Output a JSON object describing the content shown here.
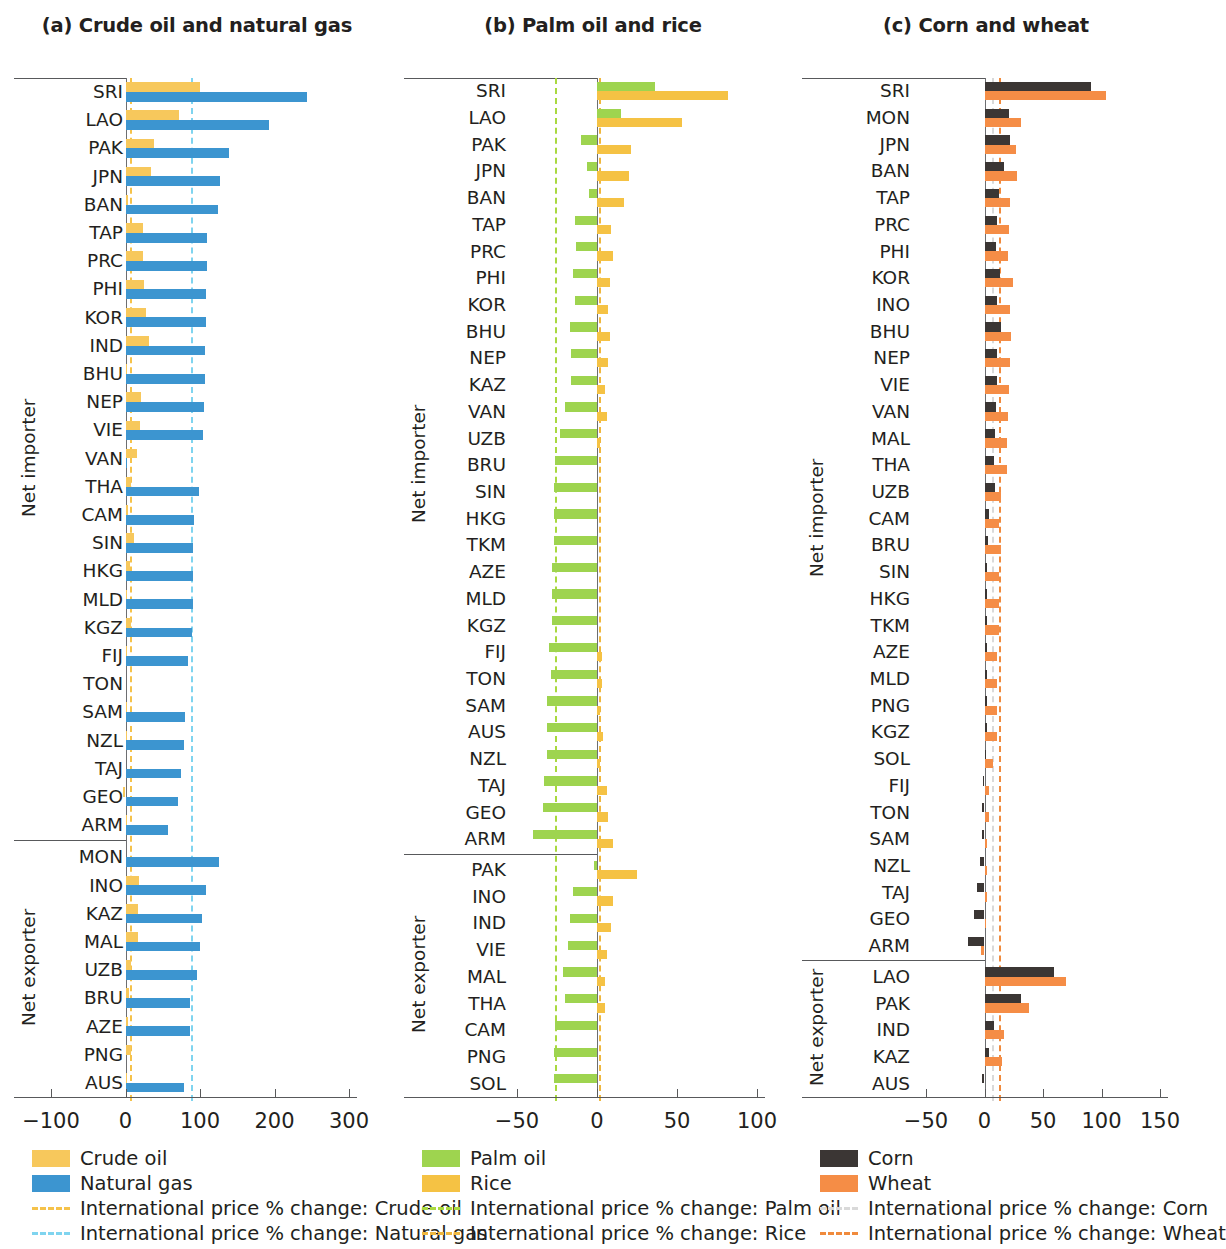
{
  "figure": {
    "type": "grouped-horizontal-bar",
    "panel_count": 3
  },
  "panels": {
    "a": {
      "title": "(a) Crude oil and natural gas",
      "group_labels": {
        "importer": "Net importer",
        "exporter": "Net exporter"
      },
      "axis": {
        "ticks": [
          -100,
          0,
          100,
          200,
          300
        ],
        "tick_labels": [
          "−100",
          "0",
          "100",
          "200",
          "300"
        ],
        "min": -135,
        "max": 335
      },
      "reflines": [
        {
          "label": "International price % change: Crude oil",
          "value": 6,
          "color": "#f5c24a"
        },
        {
          "label": "International price % change: Natural gas",
          "value": 88,
          "color": "#7fd4ef"
        }
      ],
      "series": [
        {
          "name": "Crude oil",
          "color": "#f7c85c"
        },
        {
          "name": "Natural gas",
          "color": "#3c95d0"
        }
      ],
      "legend": [
        {
          "kind": "swatch",
          "label": "Crude oil",
          "color": "#f7c85c"
        },
        {
          "kind": "swatch",
          "label": "Natural gas",
          "color": "#3c95d0"
        },
        {
          "kind": "dash",
          "label": "International price % change: Crude oil",
          "color": "#f5c24a"
        },
        {
          "kind": "dash",
          "label": "International price % change: Natural gas",
          "color": "#7fd4ef"
        }
      ]
    },
    "b": {
      "title": "(b) Palm oil and rice",
      "group_labels": {
        "importer": "Net importer",
        "exporter": "Net exporter"
      },
      "axis": {
        "ticks": [
          -50,
          0,
          50,
          100
        ],
        "tick_labels": [
          "−50",
          "0",
          "50",
          "100"
        ],
        "min": -78,
        "max": 118
      },
      "reflines": [
        {
          "label": "International price % change: Palm oil",
          "value": -26,
          "color": "#a9d93f"
        },
        {
          "label": "International price % change: Rice",
          "value": 1,
          "color": "#efb73e"
        }
      ],
      "series": [
        {
          "name": "Palm oil",
          "color": "#9ed44f"
        },
        {
          "name": "Rice",
          "color": "#f5c244"
        }
      ],
      "legend": [
        {
          "kind": "swatch",
          "label": "Palm oil",
          "color": "#9ed44f"
        },
        {
          "kind": "swatch",
          "label": "Rice",
          "color": "#f5c244"
        },
        {
          "kind": "dash",
          "label": "International price % change: Palm oil",
          "color": "#a9d93f"
        },
        {
          "kind": "dash",
          "label": "International price % change: Rice",
          "color": "#efb73e"
        }
      ]
    },
    "c": {
      "title": "(c) Corn and wheat",
      "group_labels": {
        "importer": "Net importer",
        "exporter": "Net exporter"
      },
      "axis": {
        "ticks": [
          -50,
          0,
          50,
          100,
          150
        ],
        "tick_labels": [
          "−50",
          "0",
          "50",
          "100",
          "150"
        ],
        "min": -90,
        "max": 165
      },
      "reflines": [
        {
          "label": "International price % change: Corn",
          "value": 6,
          "color": "#d9d9d9"
        },
        {
          "label": "International price % change: Wheat",
          "value": 12,
          "color": "#f08a3c"
        }
      ],
      "series": [
        {
          "name": "Corn",
          "color": "#3b3634"
        },
        {
          "name": "Wheat",
          "color": "#f58d46"
        }
      ],
      "legend": [
        {
          "kind": "swatch",
          "label": "Corn",
          "color": "#3b3634"
        },
        {
          "kind": "swatch",
          "label": "Wheat",
          "color": "#f58d46"
        },
        {
          "kind": "dash",
          "label": "International price % change: Corn",
          "color": "#d9d9d9"
        },
        {
          "kind": "dash",
          "label": "International price % change: Wheat",
          "color": "#f08a3c"
        }
      ]
    }
  },
  "chart_data": [
    {
      "panel": "a",
      "type": "bar",
      "orientation": "horizontal",
      "title": "(a) Crude oil and natural gas",
      "xlabel": "",
      "ylabel": "",
      "xlim": [
        -135,
        335
      ],
      "grid": false,
      "legend_position": "bottom",
      "series_names": [
        "Crude oil",
        "Natural gas"
      ],
      "importer": {
        "categories": [
          "SRI",
          "LAO",
          "PAK",
          "JPN",
          "BAN",
          "TAP",
          "PRC",
          "PHI",
          "KOR",
          "IND",
          "BHU",
          "NEP",
          "VIE",
          "VAN",
          "THA",
          "CAM",
          "SIN",
          "HKG",
          "MLD",
          "KGZ",
          "FIJ",
          "TON",
          "SAM",
          "NZL",
          "TAJ",
          "GEO",
          "ARM"
        ],
        "crude_oil": [
          100,
          72,
          38,
          34,
          3,
          23,
          24,
          25,
          27,
          32,
          2,
          21,
          19,
          15,
          7,
          3,
          12,
          6,
          1,
          8,
          2,
          0,
          1,
          2,
          0,
          -3,
          1
        ],
        "natural_gas": [
          243,
          193,
          139,
          127,
          124,
          110,
          110,
          108,
          108,
          107,
          107,
          105,
          104,
          1,
          99,
          92,
          91,
          91,
          90,
          89,
          84,
          0,
          80,
          78,
          75,
          70,
          57
        ]
      },
      "exporter": {
        "categories": [
          "MON",
          "INO",
          "KAZ",
          "MAL",
          "UZB",
          "BRU",
          "AZE",
          "PNG",
          "AUS"
        ],
        "crude_oil": [
          0,
          18,
          17,
          17,
          7,
          5,
          3,
          7,
          2
        ],
        "natural_gas": [
          125,
          108,
          103,
          100,
          96,
          87,
          87,
          0,
          78
        ]
      }
    },
    {
      "panel": "b",
      "type": "bar",
      "orientation": "horizontal",
      "title": "(b) Palm oil and rice",
      "xlabel": "",
      "ylabel": "",
      "xlim": [
        -78,
        118
      ],
      "grid": false,
      "legend_position": "bottom",
      "series_names": [
        "Palm oil",
        "Rice"
      ],
      "importer": {
        "categories": [
          "SRI",
          "LAO",
          "PAK",
          "JPN",
          "BAN",
          "TAP",
          "PRC",
          "PHI",
          "KOR",
          "BHU",
          "NEP",
          "KAZ",
          "VAN",
          "UZB",
          "BRU",
          "SIN",
          "HKG",
          "TKM",
          "AZE",
          "MLD",
          "KGZ",
          "FIJ",
          "TON",
          "SAM",
          "AUS",
          "NZL",
          "TAJ",
          "GEO",
          "ARM"
        ],
        "palm_oil": [
          36,
          15,
          -10,
          -6,
          -5,
          -14,
          -13,
          -15,
          -14,
          -17,
          -16,
          -16,
          -20,
          -23,
          -26,
          -27,
          -27,
          -27,
          -28,
          -28,
          -28,
          -30,
          -29,
          -31,
          -31,
          -31,
          -33,
          -34,
          -40
        ],
        "rice": [
          82,
          53,
          21,
          20,
          17,
          9,
          10,
          8,
          7,
          8,
          7,
          5,
          6,
          2,
          0,
          0,
          0,
          0,
          0,
          0,
          0,
          3,
          3,
          2,
          4,
          2,
          6,
          7,
          10
        ]
      },
      "exporter": {
        "categories": [
          "PAK",
          "INO",
          "IND",
          "VIE",
          "MAL",
          "THA",
          "CAM",
          "PNG",
          "SOL"
        ],
        "palm_oil": [
          -2,
          -15,
          -17,
          -18,
          -21,
          -20,
          -26,
          -27,
          -27
        ],
        "rice": [
          25,
          10,
          9,
          6,
          5,
          5,
          0,
          0,
          0
        ]
      }
    },
    {
      "panel": "c",
      "type": "bar",
      "orientation": "horizontal",
      "title": "(c) Corn and wheat",
      "xlabel": "",
      "ylabel": "",
      "xlim": [
        -90,
        165
      ],
      "grid": false,
      "legend_position": "bottom",
      "series_names": [
        "Corn",
        "Wheat"
      ],
      "importer": {
        "categories": [
          "SRI",
          "MON",
          "JPN",
          "BAN",
          "TAP",
          "PRC",
          "PHI",
          "KOR",
          "INO",
          "BHU",
          "NEP",
          "VIE",
          "VAN",
          "MAL",
          "THA",
          "UZB",
          "CAM",
          "BRU",
          "SIN",
          "HKG",
          "TKM",
          "AZE",
          "MLD",
          "PNG",
          "KGZ",
          "SOL",
          "FIJ",
          "TON",
          "SAM",
          "NZL",
          "TAJ",
          "GEO",
          "ARM"
        ],
        "corn": [
          91,
          21,
          22,
          17,
          12,
          11,
          10,
          13,
          11,
          14,
          11,
          11,
          10,
          9,
          8,
          9,
          4,
          3,
          2,
          2,
          2,
          2,
          2,
          2,
          2,
          1,
          -1,
          -2,
          -2,
          -4,
          -6,
          -9,
          -14
        ],
        "wheat": [
          104,
          31,
          27,
          28,
          22,
          21,
          20,
          24,
          22,
          23,
          22,
          21,
          20,
          19,
          19,
          14,
          12,
          14,
          12,
          12,
          12,
          11,
          11,
          11,
          11,
          7,
          4,
          4,
          2,
          2,
          2,
          1,
          -3
        ]
      },
      "exporter": {
        "categories": [
          "LAO",
          "PAK",
          "IND",
          "KAZ",
          "AUS"
        ],
        "corn": [
          59,
          31,
          8,
          4,
          -2
        ],
        "wheat": [
          70,
          38,
          17,
          15,
          0
        ]
      }
    }
  ]
}
